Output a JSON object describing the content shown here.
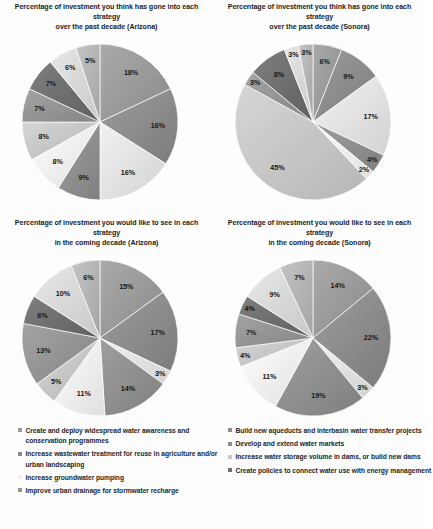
{
  "charts": [
    {
      "id": "az-past",
      "title_line1": "Percentage of investment you think has gone into each strategy",
      "title_line2": "over the past decade (Arizona)",
      "chart_data": {
        "type": "pie",
        "title": "Percentage of investment you think has gone into each strategy over the past decade (Arizona)",
        "unit": "%",
        "start_angle": -90,
        "labels": [
          "Create and deploy widespread water awareness and conservation programmes",
          "Build new aqueducts and interbasin water transfer projects",
          "Increase wastewater treatment for reuse in agriculture and/or urban landscaping",
          "Develop and extend water markets",
          "Increase groundwater pumping",
          "Increase water storage volume in dams, or build new dams",
          "Improve urban drainage for stormwater recharge",
          "Create policies to connect water use with energy management",
          "Strategy 9",
          "Strategy 10"
        ],
        "values": [
          18,
          16,
          16,
          9,
          8,
          8,
          7,
          7,
          6,
          5
        ],
        "value_labels": [
          "18%",
          "16%",
          "16%",
          "9%",
          "8%",
          "8%",
          "7%",
          "7%",
          "6%",
          "5%"
        ]
      }
    },
    {
      "id": "so-past",
      "title_line1": "Percentage of investment you think has gone into each strategy",
      "title_line2": "over the past decade (Sonora)",
      "chart_data": {
        "type": "pie",
        "title": "Percentage of investment you think has gone into each strategy over the past decade (Sonora)",
        "unit": "%",
        "start_angle": -90,
        "labels": [
          "Create and deploy widespread water awareness and conservation programmes",
          "Build new aqueducts and interbasin water transfer projects",
          "Increase wastewater treatment for reuse in agriculture and/or urban landscaping",
          "Develop and extend water markets",
          "Increase groundwater pumping",
          "Increase water storage volume in dams, or build new dams",
          "Improve urban drainage for stormwater recharge",
          "Create policies to connect water use with energy management",
          "Strategy 9",
          "Strategy 10"
        ],
        "values": [
          6,
          9,
          17,
          4,
          2,
          45,
          3,
          8,
          3,
          3
        ],
        "value_labels": [
          "6%",
          "9%",
          "17%",
          "4%",
          "2%",
          "45%",
          "3%",
          "8%",
          "3%",
          "3%"
        ]
      }
    },
    {
      "id": "az-future",
      "title_line1": "Percentage of investment you would like to see in each strategy",
      "title_line2": "in the coming decade (Arizona)",
      "chart_data": {
        "type": "pie",
        "title": "Percentage of investment you would like to see in each strategy in the coming decade (Arizona)",
        "unit": "%",
        "start_angle": -90,
        "labels": [
          "Create and deploy widespread water awareness and conservation programmes",
          "Build new aqueducts and interbasin water transfer projects",
          "Increase wastewater treatment for reuse in agriculture and/or urban landscaping",
          "Develop and extend water markets",
          "Increase groundwater pumping",
          "Increase water storage volume in dams, or build new dams",
          "Improve urban drainage for stormwater recharge",
          "Create policies to connect water use with energy management",
          "Strategy 9",
          "Strategy 10"
        ],
        "values": [
          15,
          17,
          3,
          14,
          11,
          5,
          13,
          6,
          10,
          6
        ],
        "value_labels": [
          "15%",
          "17%",
          "3%",
          "14%",
          "11%",
          "5%",
          "13%",
          "6%",
          "10%",
          "6%"
        ]
      }
    },
    {
      "id": "so-future",
      "title_line1": "Percentage of investment you would like to see in each strategy",
      "title_line2": "in the coming decade (Sonora)",
      "chart_data": {
        "type": "pie",
        "title": "Percentage of investment you would like to see in each strategy in the coming decade (Sonora)",
        "unit": "%",
        "start_angle": -90,
        "labels": [
          "Create and deploy widespread water awareness and conservation programmes",
          "Build new aqueducts and interbasin water transfer projects",
          "Increase wastewater treatment for reuse in agriculture and/or urban landscaping",
          "Develop and extend water markets",
          "Increase groundwater pumping",
          "Increase water storage volume in dams, or build new dams",
          "Improve urban drainage for stormwater recharge",
          "Create policies to connect water use with energy management",
          "Strategy 9",
          "Strategy 10"
        ],
        "values": [
          14,
          22,
          3,
          19,
          11,
          4,
          7,
          4,
          9,
          7
        ],
        "value_labels": [
          "14%",
          "22%",
          "3%",
          "19%",
          "11%",
          "4%",
          "7%",
          "4%",
          "9%",
          "7%"
        ]
      }
    }
  ],
  "slice_colors": [
    "#9a9a9a",
    "#8c8c8c",
    "#e2e2e2",
    "#8f8f8f",
    "#efefef",
    "#c6c6c6",
    "#949494",
    "#6f6f6f",
    "#d8d8d8",
    "#b4b4b4"
  ],
  "legend_left": {
    "items": [
      {
        "label": "Create and deploy widespread water awareness and conservation programmes",
        "color": "#9a9a9a"
      },
      {
        "label": "Increase wastewater treatment for reuse in agriculture and/or urban landscaping",
        "color": "#8c8c8c"
      },
      {
        "label": "Increase groundwater pumping",
        "color": "#efefef"
      },
      {
        "label": "Improve urban drainage for stormwater recharge",
        "color": "#949494"
      }
    ]
  },
  "legend_right": {
    "items": [
      {
        "label": "Build new aqueducts and interbasin water transfer projects",
        "color": "#8f8f8f"
      },
      {
        "label": "Develop and extend water markets",
        "color": "#8f8f8f"
      },
      {
        "label": "Increase water storage volume in dams, or build new dams",
        "color": "#c6c6c6"
      },
      {
        "label": "Create policies to connect water use with energy management",
        "color": "#6f6f6f"
      }
    ]
  }
}
